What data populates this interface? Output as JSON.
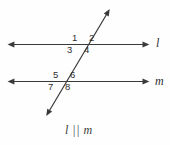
{
  "figure": {
    "background_color": "#fefefe",
    "stroke_color": "#3a3a3a",
    "text_color": "#2e2e2e"
  },
  "lines": {
    "top": {
      "name": "l",
      "label": "l",
      "label_x": 156,
      "label_y": 37
    },
    "bottom": {
      "name": "m",
      "label": "m",
      "label_x": 155,
      "label_y": 75
    },
    "transversal": {
      "name": "transversal",
      "label": ""
    }
  },
  "angles": [
    {
      "id": "1",
      "label": "1",
      "x": 72,
      "y": 33,
      "position": "upper-left-of-top-intersection"
    },
    {
      "id": "2",
      "label": "2",
      "x": 89,
      "y": 33,
      "position": "upper-right-of-top-intersection"
    },
    {
      "id": "3",
      "label": "3",
      "x": 67,
      "y": 45,
      "position": "lower-left-of-top-intersection"
    },
    {
      "id": "4",
      "label": "4",
      "x": 84,
      "y": 45,
      "position": "lower-right-of-top-intersection"
    },
    {
      "id": "5",
      "label": "5",
      "x": 53,
      "y": 70,
      "position": "upper-left-of-bottom-intersection"
    },
    {
      "id": "6",
      "label": "6",
      "x": 70,
      "y": 70,
      "position": "upper-right-of-bottom-intersection"
    },
    {
      "id": "7",
      "label": "7",
      "x": 48,
      "y": 82,
      "position": "lower-left-of-bottom-intersection"
    },
    {
      "id": "8",
      "label": "8",
      "x": 65,
      "y": 82,
      "position": "lower-right-of-bottom-intersection"
    }
  ],
  "caption": {
    "text": "l || m",
    "x": 65,
    "y": 124
  }
}
